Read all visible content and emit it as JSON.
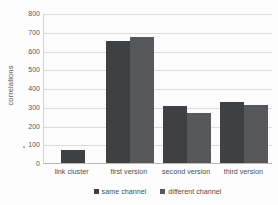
{
  "chart_data": {
    "type": "bar",
    "title": "",
    "xlabel": "",
    "ylabel": "correlations",
    "ylim": [
      0,
      800
    ],
    "ytick_step": 100,
    "yticks": [
      "800",
      "700",
      "600",
      "500",
      "400",
      "300",
      "200",
      "100",
      "0"
    ],
    "grid": true,
    "legend_position": "bottom",
    "categories": [
      "link cluster",
      "first version",
      "second version",
      "third version"
    ],
    "series": [
      {
        "name": "same channel",
        "color": "#3f4043",
        "values": [
          70,
          650,
          305,
          325
        ]
      },
      {
        "name": "different channel",
        "color": "#57585c",
        "values": [
          null,
          670,
          268,
          310
        ]
      }
    ]
  },
  "axes": {
    "y_title": "correlations"
  },
  "legend": {
    "items": [
      {
        "label": "same channel",
        "color": "#3f4043"
      },
      {
        "label": "different channel",
        "color": "#57585c"
      }
    ]
  }
}
